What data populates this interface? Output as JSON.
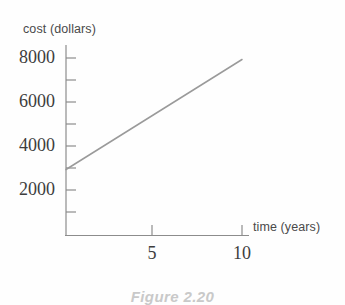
{
  "figure": {
    "caption": "Figure 2.20"
  },
  "chart_data": {
    "type": "line",
    "title": "",
    "xlabel": "time (years)",
    "ylabel": "cost (dollars)",
    "xlim": [
      0,
      11.8
    ],
    "ylim": [
      0,
      8600
    ],
    "grid": false,
    "legend": "none",
    "line_color": "#9a9a9a",
    "axis_color": "#8c8c8c",
    "x": [
      0,
      10
    ],
    "y": [
      3000,
      8000
    ],
    "series": [
      {
        "name": "cost",
        "points": [
          {
            "x": 0,
            "y": 3000
          },
          {
            "x": 10,
            "y": 8000
          }
        ]
      }
    ],
    "slope_per_year": 500,
    "intercept": 3000,
    "xticks": [
      5,
      10
    ],
    "xtick_labels": [
      "5",
      "10"
    ],
    "yticks": [
      1000,
      2000,
      3000,
      4000,
      5000,
      6000,
      7000,
      8000
    ],
    "ytick_labels_shown": [
      "2000",
      "4000",
      "6000",
      "8000"
    ],
    "ytick_label_values": [
      2000,
      4000,
      6000,
      8000
    ]
  }
}
